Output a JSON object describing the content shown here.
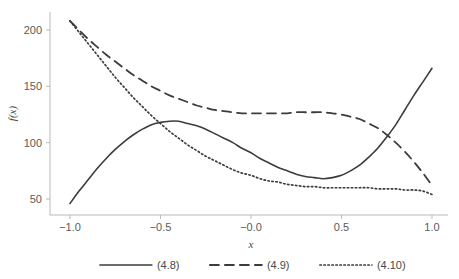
{
  "chart_data": {
    "type": "line",
    "title": "",
    "xlabel": "x",
    "ylabel": "f(x)",
    "xlim": [
      -1.1,
      1.1
    ],
    "ylim": [
      35,
      218
    ],
    "xticks": [
      -1.0,
      -0.5,
      -0.0,
      0.5,
      1.0
    ],
    "xtick_labels": [
      "−1.0",
      "−0.5",
      "−0.0",
      "0.5",
      "1.0"
    ],
    "yticks": [
      50,
      100,
      150,
      200
    ],
    "ytick_labels": [
      "50",
      "100",
      "150",
      "200"
    ],
    "grid": false,
    "legend_position": "bottom",
    "line_color": "#3c3c3c",
    "axis_color": "#b9b9b9",
    "series": [
      {
        "name": "(4.8)",
        "style": "solid",
        "x": [
          -1.0,
          -0.95,
          -0.9,
          -0.85,
          -0.8,
          -0.75,
          -0.7,
          -0.65,
          -0.6,
          -0.55,
          -0.5,
          -0.45,
          -0.4,
          -0.35,
          -0.3,
          -0.25,
          -0.2,
          -0.15,
          -0.1,
          -0.05,
          0.0,
          0.05,
          0.1,
          0.15,
          0.2,
          0.25,
          0.3,
          0.35,
          0.4,
          0.45,
          0.5,
          0.55,
          0.6,
          0.65,
          0.7,
          0.75,
          0.8,
          0.85,
          0.9,
          0.95,
          1.0
        ],
        "y": [
          46,
          57,
          67,
          77,
          86,
          94,
          101,
          107,
          112,
          116,
          118,
          119,
          119,
          117,
          115,
          112,
          108,
          104,
          100,
          95,
          91,
          86,
          82,
          78,
          75,
          72,
          70,
          69,
          68,
          69,
          71,
          75,
          80,
          87,
          95,
          105,
          116,
          129,
          142,
          154,
          166
        ]
      },
      {
        "name": "(4.9)",
        "style": "dashed",
        "x": [
          -1.0,
          -0.95,
          -0.9,
          -0.85,
          -0.8,
          -0.75,
          -0.7,
          -0.65,
          -0.6,
          -0.55,
          -0.5,
          -0.45,
          -0.4,
          -0.35,
          -0.3,
          -0.25,
          -0.2,
          -0.15,
          -0.1,
          -0.05,
          0.0,
          0.05,
          0.1,
          0.15,
          0.2,
          0.25,
          0.3,
          0.35,
          0.4,
          0.45,
          0.5,
          0.55,
          0.6,
          0.65,
          0.7,
          0.75,
          0.8,
          0.85,
          0.9,
          0.95,
          1.0
        ],
        "y": [
          208,
          200,
          192,
          185,
          178,
          172,
          166,
          160,
          155,
          150,
          146,
          142,
          139,
          136,
          133,
          131,
          129,
          128,
          127,
          126,
          126,
          126,
          126,
          126,
          126,
          127,
          127,
          127,
          127,
          126,
          125,
          123,
          121,
          117,
          113,
          107,
          100,
          92,
          83,
          73,
          62
        ]
      },
      {
        "name": "(4.10)",
        "style": "dotted",
        "x": [
          -1.0,
          -0.95,
          -0.9,
          -0.85,
          -0.8,
          -0.75,
          -0.7,
          -0.65,
          -0.6,
          -0.55,
          -0.5,
          -0.45,
          -0.4,
          -0.35,
          -0.3,
          -0.25,
          -0.2,
          -0.15,
          -0.1,
          -0.05,
          0.0,
          0.05,
          0.1,
          0.15,
          0.2,
          0.25,
          0.3,
          0.35,
          0.4,
          0.45,
          0.5,
          0.55,
          0.6,
          0.65,
          0.7,
          0.75,
          0.8,
          0.85,
          0.9,
          0.95,
          1.0
        ],
        "y": [
          208,
          198,
          188,
          178,
          168,
          158,
          149,
          140,
          132,
          124,
          117,
          110,
          104,
          98,
          93,
          88,
          84,
          80,
          76,
          73,
          71,
          68,
          66,
          65,
          63,
          62,
          61,
          61,
          60,
          60,
          60,
          60,
          60,
          60,
          59,
          59,
          59,
          58,
          58,
          57,
          54
        ]
      }
    ],
    "legend": [
      {
        "label": "(4.8)",
        "style": "solid"
      },
      {
        "label": "(4.9)",
        "style": "dashed"
      },
      {
        "label": "(4.10)",
        "style": "dotted"
      }
    ]
  }
}
